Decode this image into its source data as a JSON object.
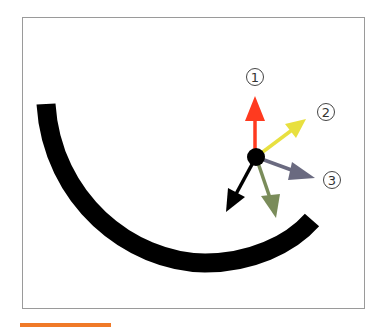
{
  "diagram": {
    "labels": [
      "1",
      "2",
      "3"
    ],
    "colors": {
      "arc": "#000000",
      "pivot": "#000000",
      "arrow_1": "#ff3a1f",
      "arrow_2": "#e8e040",
      "arrow_3": "#6a6a80",
      "arrow_green": "#7a8c5a",
      "arrow_black": "#000000",
      "frame_border": "#9a9a9a",
      "accent_bar": "#f07a28"
    }
  }
}
